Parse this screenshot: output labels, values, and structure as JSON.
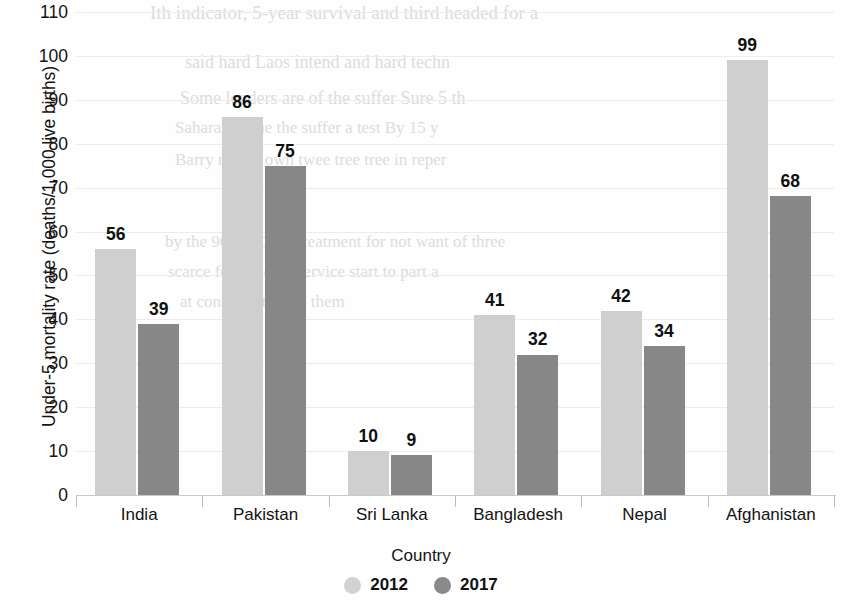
{
  "chart_data": {
    "type": "bar",
    "title": "",
    "xlabel": "Country",
    "ylabel": "Under-5 mortality rate (deaths/1,000 live births)",
    "categories": [
      "India",
      "Pakistan",
      "Sri Lanka",
      "Bangladesh",
      "Nepal",
      "Afghanistan"
    ],
    "series": [
      {
        "name": "2012",
        "color": "#cfcfcf",
        "values": [
          56,
          86,
          10,
          41,
          42,
          99
        ]
      },
      {
        "name": "2017",
        "color": "#878787",
        "values": [
          39,
          75,
          9,
          32,
          34,
          68
        ]
      }
    ],
    "ylim": [
      0,
      110
    ],
    "ytick_step": 10,
    "yticks": [
      0,
      10,
      20,
      30,
      40,
      50,
      60,
      70,
      80,
      90,
      100,
      110
    ],
    "ytick_labels": [
      "0",
      "10",
      "20",
      "30",
      "40",
      "50",
      "60",
      "70",
      "80",
      "90",
      "100",
      "110"
    ],
    "grid": true,
    "grid_axis": "y",
    "legend_position": "bottom",
    "data_labels": true
  },
  "legend": {
    "items": [
      {
        "label": "2012",
        "swatch": "y2012"
      },
      {
        "label": "2017",
        "swatch": "y2017"
      }
    ]
  },
  "artifacts": {
    "bleed_lines": [
      "Ith indicator, 5-year survival and third headed for a",
      "said hard Laos intend and hard techn",
      "Some lenders are of the suffer Sure 5 th",
      "Saharan in the the suffer a test By 15 y",
      "Barry nation own twee tree tree in reper",
      "by the 90 of 100 at treatment for not want of three",
      "scarce for the of a Service start to part a",
      "at consideration of them"
    ]
  }
}
